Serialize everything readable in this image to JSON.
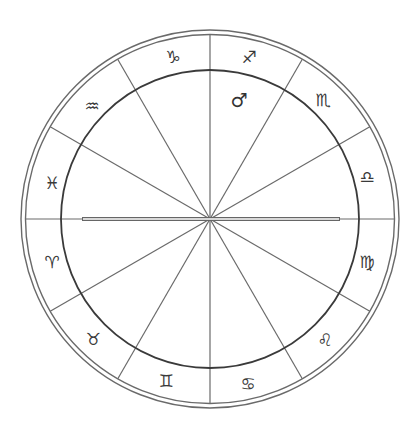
{
  "chart": {
    "center": [
      210,
      219
    ],
    "outer_radius": 189,
    "ring_radius": 184.5,
    "inner_radius": 149,
    "colors": {
      "line": "#6a6a6a",
      "inner_circle": "#3a3a3a",
      "ascendant": "#666666"
    },
    "ascendant": {
      "from_x": 82,
      "to_x": 340
    }
  },
  "zodiac_signs": [
    {
      "name": "Capricorn",
      "glyph": "♑",
      "x": 173,
      "y": 57
    },
    {
      "name": "Sagittarius",
      "glyph": "♐",
      "x": 249,
      "y": 57
    },
    {
      "name": "Scorpio",
      "glyph": "♏",
      "x": 323,
      "y": 100
    },
    {
      "name": "Libra",
      "glyph": "♎",
      "x": 367,
      "y": 177
    },
    {
      "name": "Virgo",
      "glyph": "♍",
      "x": 367,
      "y": 262
    },
    {
      "name": "Leo",
      "glyph": "♌",
      "x": 325,
      "y": 340
    },
    {
      "name": "Cancer",
      "glyph": "♋",
      "x": 248,
      "y": 384
    },
    {
      "name": "Gemini",
      "glyph": "♊",
      "x": 166,
      "y": 381
    },
    {
      "name": "Taurus",
      "glyph": "♉",
      "x": 93,
      "y": 339
    },
    {
      "name": "Aries",
      "glyph": "♈",
      "x": 52,
      "y": 262
    },
    {
      "name": "Pisces",
      "glyph": "♓",
      "x": 52,
      "y": 183
    },
    {
      "name": "Aquarius",
      "glyph": "♒",
      "x": 92,
      "y": 106
    }
  ],
  "planets": [
    {
      "name": "Mars",
      "glyph": "♂",
      "x": 239,
      "y": 100
    }
  ]
}
